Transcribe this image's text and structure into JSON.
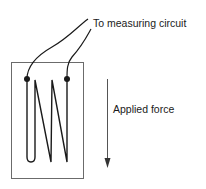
{
  "diagram": {
    "labels": {
      "measuring_circuit": "To measuring circuit",
      "applied_force": "Applied force"
    },
    "colors": {
      "line": "#1a1a1a",
      "frame": "#6b6b6b",
      "arrow": "#555555",
      "background": "#ffffff"
    },
    "components": {
      "substrate_backing": "rectangle",
      "grid": "serpentine-resistive-wire",
      "terminals": [
        "left-solder-tab",
        "right-solder-tab"
      ],
      "lead_wires": [
        "left-lead",
        "right-lead"
      ],
      "force_arrow_direction": "down"
    }
  }
}
